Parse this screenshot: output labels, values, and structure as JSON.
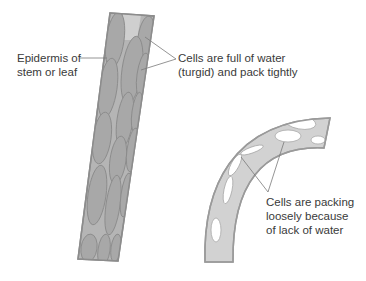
{
  "diagram": {
    "colors": {
      "stem_fill": "#b9b9b9",
      "stem_edge": "#8c8c8c",
      "cell_fill": "#a9a9a9",
      "cell_edge": "#8a8a8a",
      "wilted_fill": "#d2d2d2",
      "wilted_edge": "#9a9a9a",
      "gap_fill": "#ffffff",
      "leader_line": "#7a7a7a",
      "text": "#3a3a3a"
    },
    "labels": {
      "epidermis": {
        "line1": "Epidermis of",
        "line2": "stem or leaf"
      },
      "turgid": {
        "line1": "Cells are full of water",
        "line2": "(turgid) and pack tightly"
      },
      "wilted": {
        "line1": "Cells are packing",
        "line2": "loosely because",
        "line3": "of lack of water"
      }
    }
  }
}
